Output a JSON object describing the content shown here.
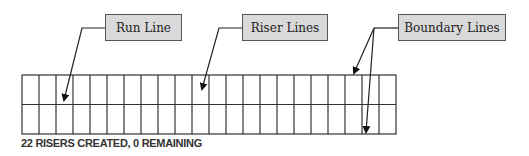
{
  "callouts": [
    {
      "label": "Run Line"
    },
    {
      "label": "Riser Lines"
    },
    {
      "label": "Boundary Lines"
    }
  ],
  "grid": {
    "columns": 22,
    "rows": 2
  },
  "status": {
    "text": "22 RISERS CREATED, 0 REMAINING"
  },
  "colors": {
    "callout_fill": "#d9d9d9",
    "line": "#333333"
  }
}
